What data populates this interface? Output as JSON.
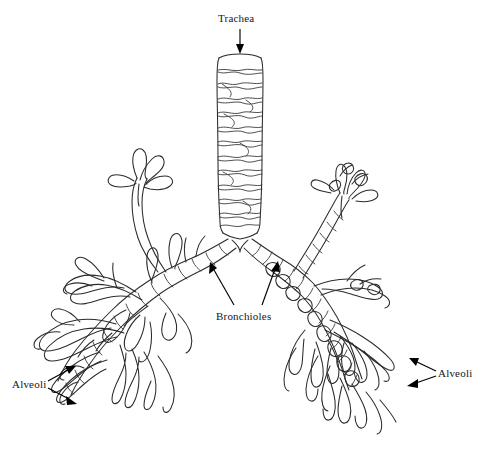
{
  "figure": {
    "background_color": "#ffffff",
    "line_color": "#2b2b2b",
    "label_color": "#161616"
  },
  "labels": {
    "trachea": {
      "text": "Trachea",
      "x": 218,
      "y": 12
    },
    "bronchioles": {
      "text": "Bronchioles",
      "x": 216,
      "y": 310
    },
    "alveoli_left": {
      "text": "Alveoli",
      "x": 12,
      "y": 385
    },
    "alveoli_right": {
      "text": "Alveoli",
      "x": 438,
      "y": 368
    }
  },
  "annotations": [
    {
      "name": "trachea-arrow",
      "from": [
        240,
        30
      ],
      "to": [
        240,
        53
      ],
      "direction": "down"
    },
    {
      "name": "bronchioles-arrow-left",
      "from": [
        233,
        306
      ],
      "to": [
        210,
        263
      ],
      "direction": "up-left"
    },
    {
      "name": "bronchioles-arrow-right",
      "from": [
        262,
        306
      ],
      "to": [
        277,
        262
      ],
      "direction": "up-right"
    },
    {
      "name": "alveoli-left-arrow-upper",
      "from": [
        50,
        382
      ],
      "to": [
        73,
        367
      ],
      "direction": "up-right"
    },
    {
      "name": "alveoli-left-arrow-lower",
      "from": [
        50,
        389
      ],
      "to": [
        74,
        403
      ],
      "direction": "down-right"
    },
    {
      "name": "alveoli-right-arrow-upper",
      "from": [
        435,
        370
      ],
      "to": [
        412,
        360
      ],
      "direction": "up-left"
    },
    {
      "name": "alveoli-right-arrow-lower",
      "from": [
        435,
        377
      ],
      "to": [
        410,
        385
      ],
      "direction": "down-left"
    }
  ],
  "structure": {
    "trachea": {
      "left_x": 217,
      "right_x": 263,
      "top_y": 57,
      "bottom_y": 228,
      "cartilage_ring_count": 12
    },
    "bifurcation": {
      "x": 240,
      "y": 237
    },
    "bronchi": [
      {
        "side": "left",
        "label": "left main bronchus",
        "tip": [
          70,
          395
        ]
      },
      {
        "side": "right",
        "label": "right main bronchus",
        "tip": [
          420,
          385
        ]
      }
    ]
  }
}
